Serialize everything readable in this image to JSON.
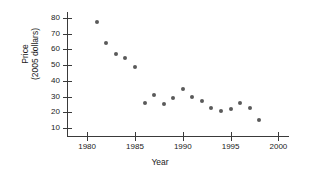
{
  "chart_data": {
    "type": "scatter",
    "title": "",
    "xlabel": "Year",
    "ylabel_line1": "Price",
    "ylabel_line2": "(2005 dollars)",
    "xlim": [
      1978,
      2001
    ],
    "ylim": [
      5,
      83
    ],
    "grid": false,
    "legend": null,
    "xticks": [
      1980,
      1985,
      1990,
      1995,
      2000
    ],
    "xtick_labels": [
      "1980",
      "1985",
      "1990",
      "1995",
      "2000"
    ],
    "yticks": [
      10,
      20,
      30,
      40,
      50,
      60,
      70,
      80
    ],
    "ytick_labels": [
      "10",
      "20",
      "30",
      "40",
      "50",
      "60",
      "70",
      "80"
    ],
    "marker_color": "#5a5a5a",
    "axis_color": "#3a3a3a",
    "x": [
      1981,
      1982,
      1983,
      1984,
      1985,
      1986,
      1987,
      1988,
      1989,
      1990,
      1991,
      1992,
      1993,
      1994,
      1995,
      1996,
      1997,
      1998
    ],
    "values": [
      77,
      64,
      57,
      54.5,
      49,
      26,
      31,
      25,
      29,
      35,
      29.5,
      27,
      22.5,
      21,
      22,
      26,
      23,
      15
    ],
    "points": [
      {
        "x": 1981,
        "y": 77
      },
      {
        "x": 1982,
        "y": 64
      },
      {
        "x": 1983,
        "y": 57
      },
      {
        "x": 1984,
        "y": 54.5
      },
      {
        "x": 1985,
        "y": 49
      },
      {
        "x": 1986,
        "y": 26
      },
      {
        "x": 1987,
        "y": 31
      },
      {
        "x": 1988,
        "y": 25
      },
      {
        "x": 1989,
        "y": 29
      },
      {
        "x": 1990,
        "y": 35
      },
      {
        "x": 1991,
        "y": 29.5
      },
      {
        "x": 1992,
        "y": 27
      },
      {
        "x": 1993,
        "y": 22.5
      },
      {
        "x": 1994,
        "y": 21
      },
      {
        "x": 1995,
        "y": 22
      },
      {
        "x": 1996,
        "y": 26
      },
      {
        "x": 1997,
        "y": 23
      },
      {
        "x": 1998,
        "y": 15
      }
    ]
  }
}
